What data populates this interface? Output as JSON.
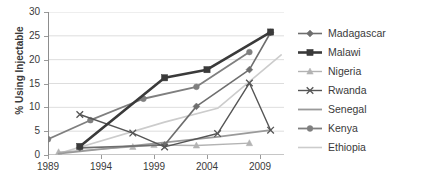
{
  "chart_data": {
    "type": "line",
    "title": "",
    "xlabel": "",
    "ylabel": "% Using Injectable",
    "xlim": [
      1989,
      2011
    ],
    "ylim": [
      0,
      30
    ],
    "xticks": [
      1989,
      1994,
      1999,
      2004,
      2009
    ],
    "yticks": [
      0,
      5,
      10,
      15,
      20,
      25,
      30
    ],
    "grid": "horizontal",
    "legend_position": "right",
    "series": [
      {
        "name": "Madagascar",
        "color": "#6e6e6e",
        "marker": "diamond",
        "width": 1.6,
        "points": [
          [
            1992,
            1.5
          ],
          [
            2000,
            2.1
          ],
          [
            2003,
            10.2
          ],
          [
            2008,
            17.9
          ],
          [
            2010,
            25.7
          ]
        ]
      },
      {
        "name": "Malawi",
        "color": "#3a3a3a",
        "marker": "square",
        "width": 2.6,
        "points": [
          [
            1992,
            1.8
          ],
          [
            2000,
            16.2
          ],
          [
            2004,
            17.9
          ],
          [
            2010,
            25.8
          ]
        ]
      },
      {
        "name": "Nigeria",
        "color": "#b3b3b3",
        "marker": "triangle",
        "width": 1.4,
        "points": [
          [
            1990,
            0.6
          ],
          [
            1997,
            1.7
          ],
          [
            1999,
            2.1
          ],
          [
            2003,
            2.0
          ],
          [
            2008,
            2.5
          ]
        ]
      },
      {
        "name": "Rwanda",
        "color": "#555555",
        "marker": "cross",
        "width": 1.4,
        "points": [
          [
            1992,
            8.5
          ],
          [
            1997,
            4.6
          ],
          [
            2000,
            1.7
          ],
          [
            2005,
            4.5
          ],
          [
            2008,
            15.1
          ],
          [
            2010,
            5.2
          ]
        ]
      },
      {
        "name": "Senegal",
        "color": "#9a9a9a",
        "marker": "none",
        "width": 1.8,
        "points": [
          [
            1990,
            0.3
          ],
          [
            2005,
            3.8
          ],
          [
            2010,
            5.2
          ]
        ]
      },
      {
        "name": "Kenya",
        "color": "#7f7f7f",
        "marker": "circle",
        "width": 1.8,
        "points": [
          [
            1989,
            3.3
          ],
          [
            1993,
            7.3
          ],
          [
            1998,
            11.8
          ],
          [
            2003,
            14.3
          ],
          [
            2008,
            21.6
          ]
        ]
      },
      {
        "name": "Ethiopia",
        "color": "#cccccc",
        "marker": "none",
        "width": 1.6,
        "points": [
          [
            1990,
            0.3
          ],
          [
            2000,
            6.9
          ],
          [
            2005,
            9.8
          ],
          [
            2011,
            21.0
          ]
        ]
      }
    ]
  },
  "axis": {
    "y_title": "% Using Injectable",
    "y_tick_labels": [
      "0",
      "5",
      "10",
      "15",
      "20",
      "25",
      "30"
    ],
    "x_tick_labels": [
      "1989",
      "1994",
      "1999",
      "2004",
      "2009"
    ]
  },
  "legend": {
    "items": [
      {
        "label": "Madagascar"
      },
      {
        "label": "Malawi"
      },
      {
        "label": "Nigeria"
      },
      {
        "label": "Rwanda"
      },
      {
        "label": "Senegal"
      },
      {
        "label": "Kenya"
      },
      {
        "label": "Ethiopia"
      }
    ]
  }
}
